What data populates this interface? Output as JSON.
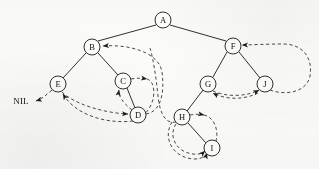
{
  "figure": {
    "kind": "diagram",
    "width": 319,
    "height": 169,
    "background_color": "#fbfbfa",
    "stroke_color": "#1a1a1a",
    "node_fill_color": "#fdfdfc",
    "thread_color": "#2a2a2a"
  },
  "nodes": [
    {
      "id": "A",
      "label": "A",
      "cx": 163,
      "cy": 20,
      "r": 8
    },
    {
      "id": "B",
      "label": "B",
      "cx": 92,
      "cy": 47,
      "r": 8
    },
    {
      "id": "F",
      "label": "F",
      "cx": 233,
      "cy": 46,
      "r": 8
    },
    {
      "id": "E",
      "label": "E",
      "cx": 58,
      "cy": 84,
      "r": 8
    },
    {
      "id": "C",
      "label": "C",
      "cx": 123,
      "cy": 81,
      "r": 8
    },
    {
      "id": "G",
      "label": "G",
      "cx": 208,
      "cy": 84,
      "r": 8
    },
    {
      "id": "J",
      "label": "J",
      "cx": 265,
      "cy": 84,
      "r": 8
    },
    {
      "id": "D",
      "label": "D",
      "cx": 138,
      "cy": 115,
      "r": 8
    },
    {
      "id": "H",
      "label": "H",
      "cx": 182,
      "cy": 117,
      "r": 8
    },
    {
      "id": "I",
      "label": "I",
      "cx": 212,
      "cy": 148,
      "r": 8
    }
  ],
  "tree_edges": [
    {
      "from": "A",
      "to": "B"
    },
    {
      "from": "A",
      "to": "F"
    },
    {
      "from": "B",
      "to": "E"
    },
    {
      "from": "B",
      "to": "C"
    },
    {
      "from": "C",
      "to": "D"
    },
    {
      "from": "F",
      "to": "G"
    },
    {
      "from": "F",
      "to": "J"
    },
    {
      "from": "G",
      "to": "H"
    },
    {
      "from": "H",
      "to": "I"
    }
  ],
  "thread_links": [
    {
      "id": "e-to-nil",
      "from": "E",
      "to": "NIL"
    },
    {
      "id": "d-to-e",
      "from": "D",
      "to": "E"
    },
    {
      "id": "e-to-d",
      "from": "E",
      "to": "D"
    },
    {
      "id": "d-to-c",
      "from": "D",
      "to": "C"
    },
    {
      "id": "c-to-d",
      "from": "C",
      "to": "D"
    },
    {
      "id": "d-to-b",
      "from": "D",
      "to": "B"
    },
    {
      "id": "h-to-b",
      "from": "H",
      "to": "B"
    },
    {
      "id": "i-to-h",
      "from": "I",
      "to": "H"
    },
    {
      "id": "h-to-i",
      "from": "H",
      "to": "I"
    },
    {
      "id": "i-to-g",
      "from": "I",
      "to": "G"
    },
    {
      "id": "g-to-j",
      "from": "G",
      "to": "J"
    },
    {
      "id": "j-to-g",
      "from": "J",
      "to": "G"
    },
    {
      "id": "j-to-f",
      "from": "J",
      "to": "F"
    }
  ],
  "nil": {
    "label": "NIL",
    "x": 21,
    "y": 102
  }
}
